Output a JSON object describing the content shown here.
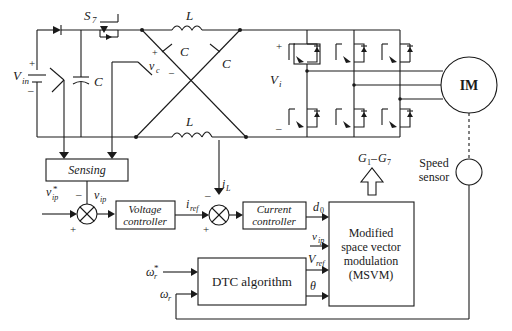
{
  "diagram": {
    "components": {
      "source": {
        "label": "V",
        "sub": "in",
        "plus": "+",
        "minus": "–"
      },
      "switch": {
        "label": "S",
        "sub": "7"
      },
      "inductor_top": "L",
      "inductor_bottom": "L",
      "cap_left": "C",
      "cap_cross_1": "C",
      "cap_cross_2": "C",
      "vc": {
        "label": "v",
        "sub": "c",
        "plus": "+",
        "minus": "–"
      },
      "vi": {
        "label": "V",
        "sub": "i",
        "plus": "+",
        "minus": "–"
      },
      "iL": {
        "label": "i",
        "sub": "L"
      },
      "motor": "IM",
      "speed_sensor": "Speed\nsensor",
      "speed_sensor_line1": "Speed",
      "speed_sensor_line2": "sensor"
    },
    "blocks": {
      "sensing": "Sensing",
      "voltage_controller_1": "Voltage",
      "voltage_controller_2": "controller",
      "current_controller_1": "Current",
      "current_controller_2": "controller",
      "dtc": "DTC algorithm",
      "msvm_1": "Modified",
      "msvm_2": "space vector",
      "msvm_3": "modulation",
      "msvm_4": "(MSVM)"
    },
    "signals": {
      "vip_ref": {
        "label": "v",
        "sup": "*",
        "sub": "ip"
      },
      "vip": {
        "label": "v",
        "sub": "ip"
      },
      "iref": {
        "label": "i",
        "sub": "ref"
      },
      "iL": {
        "label": "i",
        "sub": "L"
      },
      "d0": {
        "label": "d",
        "sub": "0"
      },
      "vip_msvm": {
        "label": "v",
        "sub": "ip"
      },
      "vref": {
        "label": "V",
        "sub": "ref"
      },
      "theta": "θ",
      "wr_ref": {
        "label": "ω",
        "sup": "*",
        "sub": "r"
      },
      "wr": {
        "label": "ω",
        "sub": "r"
      },
      "gates": {
        "g1": "G",
        "s1": "1",
        "dash": "–",
        "g7": "G",
        "s7": "7"
      },
      "sum_minus": "–",
      "sum_plus": "+"
    }
  }
}
